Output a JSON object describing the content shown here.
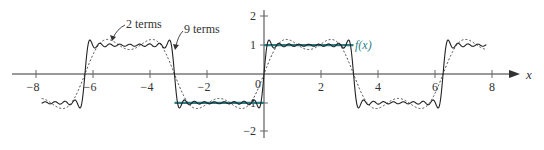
{
  "chart_data": {
    "type": "line",
    "title": "",
    "xlabel": "x",
    "ylabel": "",
    "xlim": [
      -8,
      8
    ],
    "ylim": [
      -2,
      2
    ],
    "grid": false,
    "x_ticks": [
      -8,
      -6,
      -4,
      -2,
      2,
      4,
      6,
      8
    ],
    "x_tick_labels": [
      "−8",
      "−6",
      "−4",
      "−2",
      "2",
      "4",
      "6",
      "8"
    ],
    "y_ticks": [
      2,
      1,
      -1,
      -2
    ],
    "y_tick_labels": [
      "2",
      "1",
      "−1",
      "−2"
    ],
    "origin_label": "0",
    "series": [
      {
        "name": "f(x)",
        "description": "square wave: f(x) = -1 on (-π, 0), f(x) = 1 on (0, π)",
        "style": "solid-thick",
        "color": "#2a7f86",
        "segments": [
          {
            "x": [
              -3.1416,
              0
            ],
            "y": [
              -1,
              -1
            ]
          },
          {
            "x": [
              0,
              3.1416
            ],
            "y": [
              1,
              1
            ]
          }
        ]
      },
      {
        "name": "2 terms",
        "description": "Fourier partial sum (4/π)[sin x + sin(3x)/3]",
        "style": "dotted",
        "color": "#333333",
        "terms": 2,
        "x_range": [
          -7.8,
          7.8
        ]
      },
      {
        "name": "9 terms",
        "description": "Fourier partial sum (4/π)Σ_{k=1..9} sin((2k-1)x)/(2k-1)",
        "style": "solid",
        "color": "#222222",
        "terms": 9,
        "x_range": [
          -7.8,
          7.8
        ]
      }
    ],
    "annotations": [
      {
        "text": "2 terms",
        "points_to": "dotted curve near x≈-5.3, y≈1.1"
      },
      {
        "text": "9 terms",
        "points_to": "solid curve near x≈-3.2, y≈0.9"
      },
      {
        "text": "f(x)",
        "position": "right end of f(x) segment at x≈3.3, y=1"
      }
    ]
  },
  "labels": {
    "two_terms": "2 terms",
    "nine_terms": "9 terms",
    "fx": "f(x)",
    "x_axis": "x",
    "origin": "0",
    "xt0": "−8",
    "xt1": "−6",
    "xt2": "−4",
    "xt3": "−2",
    "xt4": "2",
    "xt5": "4",
    "xt6": "6",
    "xt7": "8",
    "yt0": "2",
    "yt1": "1",
    "yt2": "−1",
    "yt3": "−2"
  }
}
